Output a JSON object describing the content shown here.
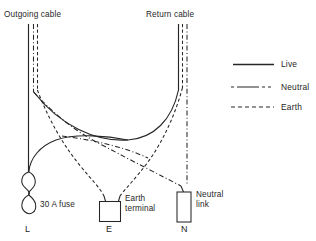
{
  "figure": {
    "kind": "electrical-wiring-diagram",
    "title_top_left": "Outgoing cable",
    "title_top_right": "Return cable",
    "background_color": "#ffffff",
    "ink_color": "#262626"
  },
  "labels": {
    "outgoing_cable": "Outgoing cable",
    "return_cable": "Return cable",
    "fuse": "30 A fuse",
    "earth_terminal_line1": "Earth",
    "earth_terminal_line2": "terminal",
    "neutral_link_line1": "Neutral",
    "neutral_link_line2": "link",
    "node_l": "L",
    "node_e": "E",
    "node_n": "N"
  },
  "legend": {
    "position": "right",
    "items": [
      {
        "label": "Live",
        "style": "solid",
        "color": "#262626"
      },
      {
        "label": "Neutral",
        "style": "dash-dot",
        "color": "#262626"
      },
      {
        "label": "Earth",
        "style": "dashed",
        "color": "#262626"
      }
    ]
  },
  "components": [
    {
      "name": "30 A fuse",
      "shape": "figure-eight-coil",
      "terminal": "L"
    },
    {
      "name": "Earth terminal",
      "shape": "rectangle",
      "terminal": "E"
    },
    {
      "name": "Neutral link",
      "shape": "tall-rectangle",
      "terminal": "N"
    }
  ],
  "conductors": [
    {
      "name": "live",
      "style": "solid",
      "from": "Outgoing cable",
      "to": "N terminal area"
    },
    {
      "name": "neutral",
      "style": "dash-dot",
      "from": "Outgoing cable",
      "to": "Return cable"
    },
    {
      "name": "earth",
      "style": "dashed",
      "from": "Outgoing cable",
      "to": "E terminal"
    }
  ]
}
